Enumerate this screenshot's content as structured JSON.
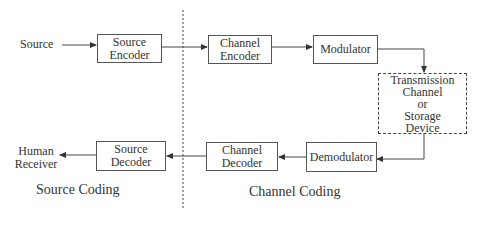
{
  "diagram": {
    "inputs": {
      "source": "Source"
    },
    "outputs": {
      "receiver_line1": "Human",
      "receiver_line2": "Receiver"
    },
    "blocks": {
      "source_encoder": [
        "Source",
        "Encoder"
      ],
      "channel_encoder": [
        "Channel",
        "Encoder"
      ],
      "modulator": [
        "Modulator"
      ],
      "channel": [
        "Transmission",
        "Channel",
        "or",
        "Storage",
        "Device"
      ],
      "demodulator": [
        "Demodulator"
      ],
      "channel_decoder": [
        "Channel",
        "Decoder"
      ],
      "source_decoder": [
        "Source",
        "Decoder"
      ]
    },
    "sections": {
      "source_coding": "Source Coding",
      "channel_coding": "Channel Coding"
    },
    "colors": {
      "line": "#444444",
      "divider": "#666666"
    }
  }
}
